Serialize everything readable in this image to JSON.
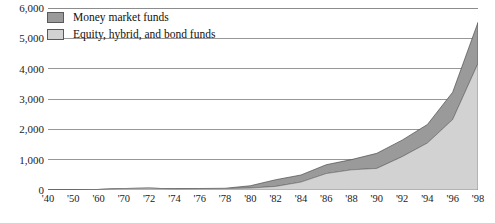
{
  "chart_data": {
    "type": "area",
    "stacked": true,
    "title": "",
    "subtitle": "",
    "xlabel": "",
    "ylabel": "",
    "ylim": [
      0,
      6000
    ],
    "ytick_labels": [
      "0",
      "1,000",
      "2,000",
      "3,000",
      "4,000",
      "5,000",
      "6,000"
    ],
    "ytick_values": [
      0,
      1000,
      2000,
      3000,
      4000,
      5000,
      6000
    ],
    "grid": true,
    "grid_axis": "y",
    "legend_position": "top-left",
    "xtick_labels": [
      "'40",
      "'50",
      "'60",
      "'70",
      "'72",
      "'74",
      "'76",
      "'78",
      "'80",
      "'82",
      "'84",
      "'86",
      "'88",
      "'90",
      "'92",
      "'94",
      "'96",
      "'98"
    ],
    "x": [
      1940,
      1950,
      1960,
      1970,
      1972,
      1974,
      1976,
      1978,
      1980,
      1982,
      1984,
      1986,
      1988,
      1990,
      1992,
      1994,
      1996,
      1998
    ],
    "series": [
      {
        "name": "Equity, hybrid, and bond funds",
        "color": "#d2d2d2",
        "values": [
          0,
          3,
          17,
          48,
          60,
          36,
          45,
          46,
          63,
          118,
          260,
          541,
          664,
          711,
          1098,
          1548,
          2324,
          4174
        ]
      },
      {
        "name": "Money market funds",
        "color": "#9a9a9a",
        "values": [
          0,
          0,
          0,
          0,
          0,
          2,
          4,
          11,
          77,
          220,
          234,
          292,
          338,
          498,
          546,
          611,
          902,
          1352
        ]
      }
    ]
  },
  "legend": {
    "items": [
      {
        "label": "Money market funds",
        "swatch_class": "money"
      },
      {
        "label": "Equity, hybrid, and bond funds",
        "swatch_class": "equity"
      }
    ]
  },
  "colors": {
    "money_market": "#9a9a9a",
    "equity_bond": "#d2d2d2",
    "gridline": "#8c8c8c",
    "axis": "#333333",
    "text": "#1a1a1a"
  }
}
